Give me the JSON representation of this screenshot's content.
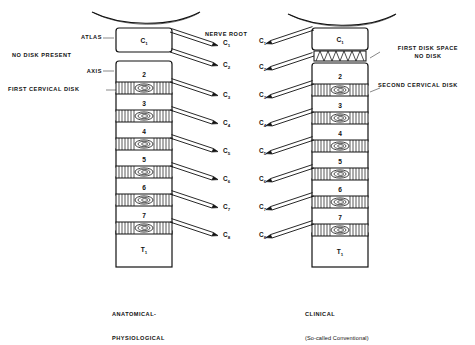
{
  "figure": {
    "title_center": "NERVE ROOT",
    "left_panel": {
      "caption_line1": "ANATOMICAL-",
      "caption_line2": "PHYSIOLOGICAL",
      "annotations": [
        {
          "name": "atlas",
          "text": "ATLAS"
        },
        {
          "name": "no-disk-present",
          "text": "NO DISK PRESENT"
        },
        {
          "name": "axis",
          "text": "AXIS"
        },
        {
          "name": "first-cervical-disk",
          "text": "FIRST CERVICAL DISK"
        }
      ],
      "vertebrae": [
        {
          "label": "C",
          "sub": "1"
        },
        {
          "label": "2",
          "sub": ""
        },
        {
          "label": "3",
          "sub": ""
        },
        {
          "label": "4",
          "sub": ""
        },
        {
          "label": "5",
          "sub": ""
        },
        {
          "label": "6",
          "sub": ""
        },
        {
          "label": "7",
          "sub": ""
        },
        {
          "label": "T",
          "sub": "1"
        }
      ],
      "nerve_roots": [
        {
          "label": "C",
          "sub": "1"
        },
        {
          "label": "C",
          "sub": "2"
        },
        {
          "label": "C",
          "sub": "3"
        },
        {
          "label": "C",
          "sub": "4"
        },
        {
          "label": "C",
          "sub": "5"
        },
        {
          "label": "C",
          "sub": "6"
        },
        {
          "label": "C",
          "sub": "7"
        },
        {
          "label": "C",
          "sub": "8"
        }
      ]
    },
    "right_panel": {
      "caption_line1": "CLINICAL",
      "caption_line2": "(So-called Conventional)",
      "annotations": [
        {
          "name": "first-disk-space-no-disk",
          "text": "FIRST DISK SPACE\nNO DISK"
        },
        {
          "name": "second-cervical-disk",
          "text": "SECOND CERVICAL DISK"
        }
      ],
      "vertebrae": [
        {
          "label": "C",
          "sub": "1"
        },
        {
          "label": "2",
          "sub": ""
        },
        {
          "label": "3",
          "sub": ""
        },
        {
          "label": "4",
          "sub": ""
        },
        {
          "label": "5",
          "sub": ""
        },
        {
          "label": "6",
          "sub": ""
        },
        {
          "label": "7",
          "sub": ""
        },
        {
          "label": "T",
          "sub": "1"
        }
      ],
      "nerve_roots": [
        {
          "label": "C",
          "sub": "1"
        },
        {
          "label": "C",
          "sub": "2"
        },
        {
          "label": "C",
          "sub": "3"
        },
        {
          "label": "C",
          "sub": "4"
        },
        {
          "label": "C",
          "sub": "5"
        },
        {
          "label": "C",
          "sub": "6"
        },
        {
          "label": "C",
          "sub": "7"
        },
        {
          "label": "C",
          "sub": "8"
        }
      ]
    },
    "colors": {
      "ink": "#111111",
      "paper": "#ffffff"
    }
  }
}
